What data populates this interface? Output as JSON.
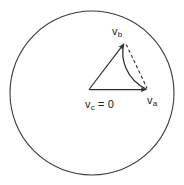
{
  "figure": {
    "title": "",
    "background_color": "#ffffff",
    "stroke_color": "#2b2b2b",
    "text_color": "#1a1a1a",
    "labels": {
      "vb": {
        "symbol": "v",
        "subscript": "b",
        "text": "v_b"
      },
      "vc": {
        "symbol": "v",
        "subscript": "c",
        "suffix": " = 0",
        "text": "v_c = 0"
      },
      "va": {
        "symbol": "v",
        "subscript": "a",
        "text": "v_a"
      }
    },
    "geometry": {
      "circle": {
        "cx": 92,
        "cy": 93,
        "r": 82
      },
      "vertices": {
        "vc": {
          "x": 89,
          "y": 90
        },
        "va": {
          "x": 147,
          "y": 90
        },
        "vb": {
          "x": 124,
          "y": 42
        }
      },
      "edges": [
        {
          "name": "vc-to-vb",
          "style": "solid",
          "arrowhead": "end"
        },
        {
          "name": "vc-to-va",
          "style": "solid",
          "arrowhead": "end"
        },
        {
          "name": "vb-to-va-curve",
          "style": "solid-curved",
          "arrowhead": "none"
        },
        {
          "name": "vb-to-va-chord",
          "style": "dashed",
          "arrowhead": "none"
        }
      ]
    }
  }
}
